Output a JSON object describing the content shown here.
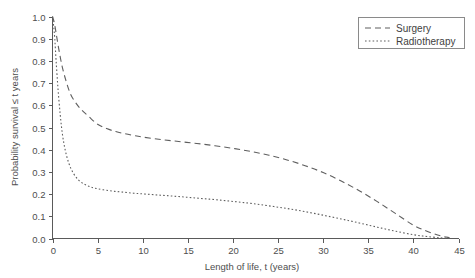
{
  "chart_data": {
    "type": "line",
    "title": "",
    "xlabel": "Length of life, t (years)",
    "ylabel": "Probability survival ≤ t years",
    "xlim": [
      0,
      45
    ],
    "ylim": [
      0.0,
      1.0
    ],
    "xticks": [
      "0",
      "5",
      "10",
      "15",
      "20",
      "25",
      "30",
      "35",
      "40",
      "45"
    ],
    "xtick_values": [
      0,
      5,
      10,
      15,
      20,
      25,
      30,
      35,
      40,
      45
    ],
    "yticks": [
      "0.0",
      "0.1",
      "0.2",
      "0.3",
      "0.4",
      "0.5",
      "0.6",
      "0.7",
      "0.8",
      "0.9",
      "1.0"
    ],
    "ytick_values": [
      0.0,
      0.1,
      0.2,
      0.3,
      0.4,
      0.5,
      0.6,
      0.7,
      0.8,
      0.9,
      1.0
    ],
    "grid": false,
    "legend_position": "top-right",
    "series": [
      {
        "name": "Surgery",
        "style": "dashed",
        "color": "#5f5f5f",
        "x": [
          0.0,
          0.15,
          0.3,
          0.5,
          0.8,
          1.1,
          1.5,
          2.0,
          2.6,
          3.2,
          4.0,
          5.0,
          6.0,
          7.0,
          8.0,
          9.0,
          10.0,
          12.0,
          14.0,
          16.0,
          18.0,
          20.0,
          22.0,
          24.0,
          26.0,
          28.0,
          30.0,
          32.0,
          34.0,
          36.0,
          38.0,
          40.0,
          41.5,
          43.0,
          44.0
        ],
        "y": [
          1.0,
          0.98,
          0.95,
          0.9,
          0.83,
          0.77,
          0.71,
          0.65,
          0.61,
          0.58,
          0.55,
          0.515,
          0.495,
          0.482,
          0.472,
          0.464,
          0.457,
          0.446,
          0.437,
          0.428,
          0.418,
          0.406,
          0.392,
          0.375,
          0.354,
          0.328,
          0.297,
          0.259,
          0.215,
          0.166,
          0.113,
          0.06,
          0.033,
          0.012,
          0.004
        ]
      },
      {
        "name": "Radiotherapy",
        "style": "dotted",
        "color": "#5f5f5f",
        "x": [
          0.0,
          0.12,
          0.25,
          0.4,
          0.6,
          0.85,
          1.1,
          1.4,
          1.8,
          2.3,
          2.9,
          3.6,
          4.3,
          5.0,
          6.0,
          7.0,
          8.0,
          9.0,
          10.0,
          12.0,
          14.0,
          16.0,
          18.0,
          20.0,
          22.0,
          24.0,
          26.0,
          28.0,
          30.0,
          32.0,
          34.0,
          36.0,
          38.0,
          40.0,
          41.5,
          43.0,
          44.0
        ],
        "y": [
          1.0,
          0.96,
          0.9,
          0.8,
          0.68,
          0.56,
          0.47,
          0.4,
          0.34,
          0.295,
          0.263,
          0.243,
          0.231,
          0.224,
          0.217,
          0.212,
          0.208,
          0.204,
          0.201,
          0.195,
          0.189,
          0.182,
          0.175,
          0.167,
          0.158,
          0.147,
          0.135,
          0.121,
          0.105,
          0.088,
          0.07,
          0.051,
          0.033,
          0.017,
          0.009,
          0.003,
          0.001
        ]
      }
    ]
  },
  "legend": {
    "items": [
      {
        "label": "Surgery",
        "style": "dashed"
      },
      {
        "label": "Radiotherapy",
        "style": "dotted"
      }
    ]
  }
}
